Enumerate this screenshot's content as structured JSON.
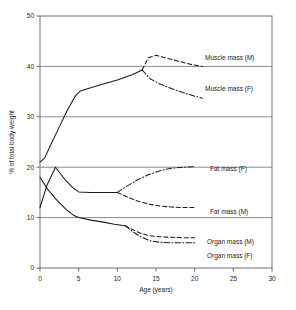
{
  "chart_data": {
    "type": "line",
    "title": "",
    "subtitle": "",
    "xlabel": "Age (years)",
    "ylabel": "% of total body weight",
    "xlim": [
      0,
      30
    ],
    "ylim": [
      0,
      50
    ],
    "xticks": [
      0,
      5,
      10,
      15,
      20,
      25,
      30
    ],
    "yticks": [
      0,
      10,
      20,
      30,
      40,
      50
    ],
    "xtick_labels": [
      "0",
      "5",
      "10",
      "15",
      "20",
      "25",
      "30"
    ],
    "ytick_labels": [
      "0",
      "10",
      "20",
      "30",
      "40",
      "50"
    ],
    "grid": "horizontal",
    "legend_position": "inline-right",
    "series": [
      {
        "name": "Muscle mass (common)",
        "label": "",
        "style": "solid",
        "x": [
          0,
          0.6,
          1.4,
          2.5,
          3.6,
          4.6,
          5.2,
          7.5,
          10,
          12,
          13.2
        ],
        "y": [
          21.0,
          21.8,
          24.5,
          28.0,
          31.5,
          34.2,
          35.1,
          36.2,
          37.3,
          38.4,
          39.3
        ]
      },
      {
        "name": "Muscle mass (M)",
        "label": "Muscle mass (M)",
        "style": "dashed",
        "x": [
          13.2,
          14.0,
          15.0,
          16.5,
          18.0,
          19.5,
          21.0
        ],
        "y": [
          39.3,
          41.7,
          42.2,
          41.6,
          41.0,
          40.4,
          40.0
        ]
      },
      {
        "name": "Muscle mass (F)",
        "label": "Muscle mass (F)",
        "style": "dashdot",
        "x": [
          13.2,
          14.2,
          15.5,
          17.0,
          18.5,
          20.0,
          21.0
        ],
        "y": [
          39.3,
          37.6,
          36.5,
          35.6,
          34.8,
          34.1,
          33.7
        ]
      },
      {
        "name": "Fat mass (common)",
        "label": "",
        "style": "solid",
        "x": [
          0,
          0.9,
          2.0,
          3.2,
          4.2,
          5.0,
          6.5,
          8.0,
          10.0
        ],
        "y": [
          12.0,
          16.4,
          20.0,
          17.6,
          16.0,
          15.1,
          15.0,
          15.0,
          15.0
        ]
      },
      {
        "name": "Fat mass (F)",
        "label": "Fat mass (F)",
        "style": "dashdot",
        "x": [
          10.0,
          11.2,
          12.5,
          14.0,
          15.5,
          17.0,
          18.5,
          20.0
        ],
        "y": [
          15.0,
          16.2,
          17.4,
          18.5,
          19.3,
          19.8,
          20.0,
          20.1
        ]
      },
      {
        "name": "Fat mass (M)",
        "label": "Fat mass (M)",
        "style": "dashed",
        "x": [
          10.0,
          11.3,
          12.6,
          14.0,
          15.5,
          17.0,
          18.5,
          20.0
        ],
        "y": [
          15.0,
          14.1,
          13.3,
          12.7,
          12.3,
          12.1,
          12.0,
          12.0
        ]
      },
      {
        "name": "Organ mass (common)",
        "label": "",
        "style": "solid",
        "x": [
          0,
          1.0,
          2.2,
          3.4,
          4.4,
          5.0,
          6.6,
          8.2,
          9.6,
          11.0
        ],
        "y": [
          18.0,
          15.6,
          13.4,
          11.6,
          10.4,
          10.0,
          9.5,
          9.1,
          8.7,
          8.4
        ]
      },
      {
        "name": "Organ mass (M)",
        "label": "Organ mass (M)",
        "style": "dashed",
        "x": [
          11.0,
          12.0,
          13.0,
          14.2,
          15.5,
          17.0,
          18.5,
          20.0
        ],
        "y": [
          8.4,
          7.6,
          6.9,
          6.4,
          6.2,
          6.1,
          6.0,
          6.0
        ]
      },
      {
        "name": "Organ mass (F)",
        "label": "Organ mass (F)",
        "style": "dashdot",
        "x": [
          11.0,
          12.0,
          13.0,
          14.2,
          15.5,
          17.0,
          18.5,
          20.0
        ],
        "y": [
          8.4,
          7.2,
          6.2,
          5.4,
          5.1,
          5.0,
          5.0,
          5.0
        ]
      }
    ],
    "annotations": [
      {
        "name": "muscle-mass-m-label",
        "text": "Muscle mass (M)",
        "x_px": 205,
        "y_px": 60
      },
      {
        "name": "muscle-mass-f-label",
        "text": "Muscle mass (F)",
        "x_px": 205,
        "y_px": 91
      },
      {
        "name": "fat-mass-f-label",
        "text": "Fat mass (F)",
        "x_px": 210,
        "y_px": 171
      },
      {
        "name": "fat-mass-m-label",
        "text": "Fat mass (M)",
        "x_px": 210,
        "y_px": 214
      },
      {
        "name": "organ-mass-m-label",
        "text": "Organ mass (M)",
        "x_px": 207,
        "y_px": 244
      },
      {
        "name": "organ-mass-f-label",
        "text": "Organ mass (F)",
        "x_px": 207,
        "y_px": 258
      }
    ]
  }
}
